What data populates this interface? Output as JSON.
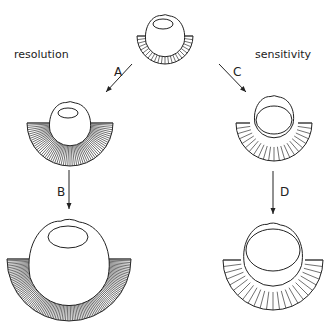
{
  "labels": {
    "left_title": "resolution",
    "right_title": "sensitivity",
    "arrow_a": "A",
    "arrow_b": "B",
    "arrow_c": "C",
    "arrow_d": "D"
  },
  "eyes": [
    {
      "id": "ancestral",
      "cx": 165,
      "cy": 36,
      "head_r": 20,
      "fan_inner": 18,
      "fan_outer": 28,
      "fan_cy": 36,
      "rays": 24,
      "lens": {
        "cx": 163,
        "cy": 24,
        "rx": 10,
        "ry": 5
      }
    },
    {
      "id": "resolution-1",
      "cx": 70,
      "cy": 124,
      "head_r": 21,
      "fan_inner": 20,
      "fan_outer": 43,
      "fan_cy": 123,
      "rays": 60,
      "lens": {
        "cx": 68,
        "cy": 113,
        "rx": 10,
        "ry": 5
      }
    },
    {
      "id": "resolution-2",
      "cx": 69,
      "cy": 263,
      "head_r": 41,
      "fan_inner": 39,
      "fan_outer": 62,
      "fan_cy": 259,
      "rays": 110,
      "lens": {
        "cx": 68,
        "cy": 237,
        "rx": 20,
        "ry": 11
      }
    },
    {
      "id": "sensitivity-1",
      "cx": 274,
      "cy": 117,
      "head_r": 20,
      "fan_inner": 24,
      "fan_outer": 38,
      "fan_cy": 123,
      "rays": 22,
      "lens": {
        "cx": 274,
        "cy": 120,
        "rx": 18,
        "ry": 14
      }
    },
    {
      "id": "sensitivity-2",
      "cx": 273,
      "cy": 255,
      "head_r": 30,
      "fan_inner": 32,
      "fan_outer": 50,
      "fan_cy": 260,
      "rays": 24,
      "lens": {
        "cx": 273,
        "cy": 250,
        "rx": 27,
        "ry": 21
      }
    }
  ],
  "arrows": [
    {
      "id": "A",
      "x1": 132,
      "y1": 64,
      "x2": 106,
      "y2": 92,
      "lx": 114,
      "ly": 76
    },
    {
      "id": "C",
      "x1": 219,
      "y1": 64,
      "x2": 246,
      "y2": 92,
      "lx": 233,
      "ly": 76
    },
    {
      "id": "B",
      "x1": 69,
      "y1": 170,
      "x2": 69,
      "y2": 209,
      "lx": 57,
      "ly": 196
    },
    {
      "id": "D",
      "x1": 273,
      "y1": 171,
      "x2": 273,
      "y2": 214,
      "lx": 280,
      "ly": 196
    }
  ]
}
